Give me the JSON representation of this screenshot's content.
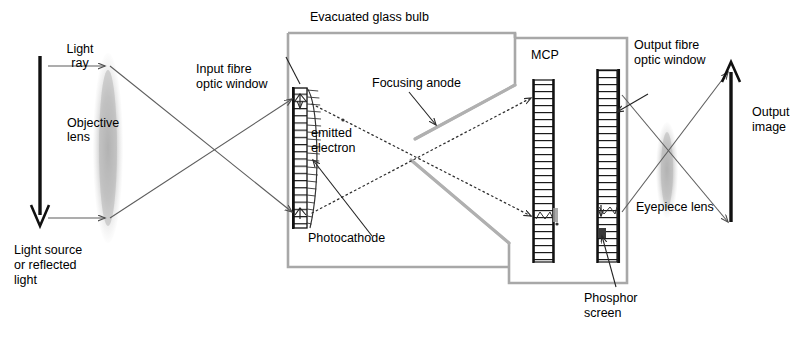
{
  "diagram": {
    "colors": {
      "ink": "#000000",
      "bulb_outline": "#a8a8a8",
      "ray_line": "#555555",
      "electron_path": "#333333",
      "lens_glow": "#bdbdbd",
      "background": "#ffffff"
    },
    "labels": {
      "evacuated_glass_bulb": "Evacuated glass bulb",
      "light_ray": "Light\nray",
      "light_ray_line1": "Light",
      "light_ray_line2": "ray",
      "objective_lens_line1": "Objective",
      "objective_lens_line2": "lens",
      "light_source_line1": "Light source",
      "light_source_line2": "or reflected",
      "light_source_line3": "light",
      "input_window_line1": "Input fibre",
      "input_window_line2": "optic window",
      "emitted_electron_line1": "emitted",
      "emitted_electron_line2": "electron",
      "photocathode": "Photocathode",
      "focusing_anode": "Focusing anode",
      "mcp": "MCP",
      "output_window_line1": "Output fibre",
      "output_window_line2": "optic window",
      "output_image_line1": "Output",
      "output_image_line2": "image",
      "eyepiece_lens": "Eyepiece lens",
      "phosphor_screen_line1": "Phosphor",
      "phosphor_screen_line2": "screen"
    },
    "components": [
      {
        "name": "light-source-arrow",
        "kind": "arrow",
        "direction": "down"
      },
      {
        "name": "objective-lens",
        "kind": "lens"
      },
      {
        "name": "input-fibre-optic-window",
        "kind": "hatched-plate"
      },
      {
        "name": "photocathode",
        "kind": "curved-layer"
      },
      {
        "name": "focusing-anode",
        "kind": "electrode"
      },
      {
        "name": "mcp",
        "kind": "hatched-plate"
      },
      {
        "name": "output-fibre-optic-window",
        "kind": "hatched-plate"
      },
      {
        "name": "phosphor-screen",
        "kind": "layer"
      },
      {
        "name": "eyepiece-lens",
        "kind": "lens"
      },
      {
        "name": "output-image-arrow",
        "kind": "arrow",
        "direction": "up"
      }
    ]
  }
}
